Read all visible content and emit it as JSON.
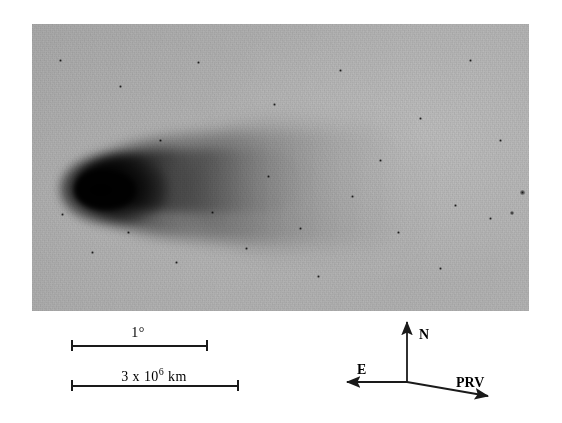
{
  "figure": {
    "type": "astronomical-plate",
    "plate": {
      "background_color": "#b0b0b0",
      "left": 32,
      "top": 24,
      "width": 497,
      "height": 287
    },
    "comet": {
      "coma_center_x": 88,
      "coma_center_y": 184,
      "tail_direction": "right",
      "tail_extent_px": 345,
      "core_color": "#000000"
    },
    "stars": [
      {
        "x": 522,
        "y": 192,
        "size": 5
      },
      {
        "x": 512,
        "y": 213,
        "size": 4
      },
      {
        "x": 490,
        "y": 218,
        "size": 3
      },
      {
        "x": 455,
        "y": 205,
        "size": 3
      },
      {
        "x": 398,
        "y": 232,
        "size": 3
      },
      {
        "x": 352,
        "y": 196,
        "size": 3
      },
      {
        "x": 300,
        "y": 228,
        "size": 3
      },
      {
        "x": 268,
        "y": 176,
        "size": 3
      },
      {
        "x": 246,
        "y": 248,
        "size": 3
      },
      {
        "x": 212,
        "y": 212,
        "size": 3
      },
      {
        "x": 176,
        "y": 262,
        "size": 3
      },
      {
        "x": 128,
        "y": 232,
        "size": 3
      },
      {
        "x": 92,
        "y": 252,
        "size": 3
      },
      {
        "x": 62,
        "y": 214,
        "size": 3
      },
      {
        "x": 120,
        "y": 86,
        "size": 3
      },
      {
        "x": 198,
        "y": 62,
        "size": 3
      },
      {
        "x": 274,
        "y": 104,
        "size": 3
      },
      {
        "x": 340,
        "y": 70,
        "size": 3
      },
      {
        "x": 420,
        "y": 118,
        "size": 3
      },
      {
        "x": 470,
        "y": 60,
        "size": 3
      },
      {
        "x": 500,
        "y": 140,
        "size": 3
      },
      {
        "x": 160,
        "y": 140,
        "size": 3
      },
      {
        "x": 60,
        "y": 60,
        "size": 3
      },
      {
        "x": 380,
        "y": 160,
        "size": 3
      },
      {
        "x": 440,
        "y": 268,
        "size": 3
      },
      {
        "x": 318,
        "y": 276,
        "size": 3
      }
    ]
  },
  "scale_bars": [
    {
      "id": "angular",
      "label_text": "1°",
      "label_prefix": "1",
      "label_suffix": "°",
      "x_start": 71,
      "x_end": 206,
      "y": 345,
      "label_x": 138,
      "label_y": 325
    },
    {
      "id": "linear",
      "label_text": "3 x 10⁶ km",
      "label_prefix": "3 x 10",
      "label_exponent": "6",
      "label_suffix": " km",
      "x_start": 71,
      "x_end": 237,
      "y": 385,
      "label_x": 154,
      "label_y": 366
    }
  ],
  "compass": {
    "origin_x": 407,
    "origin_y": 382,
    "directions": [
      {
        "name": "north",
        "label": "N",
        "tip_x": 407,
        "tip_y": 322,
        "label_x": 419,
        "label_y": 327
      },
      {
        "name": "east",
        "label": "E",
        "tip_x": 347,
        "tip_y": 382,
        "label_x": 357,
        "label_y": 362
      },
      {
        "name": "projected-radius-vector",
        "label": "PRV",
        "tip_x": 488,
        "tip_y": 396,
        "label_x": 456,
        "label_y": 375
      }
    ],
    "line_color": "#1a1a1a"
  }
}
